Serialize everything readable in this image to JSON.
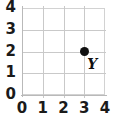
{
  "chart_data": {
    "type": "scatter",
    "title": "",
    "xlabel": "",
    "ylabel": "",
    "xlim": [
      0,
      4
    ],
    "ylim": [
      0,
      4
    ],
    "grid": true,
    "legend": false,
    "x_ticks": [
      "0",
      "1",
      "2",
      "3",
      "4"
    ],
    "y_ticks": [
      "0",
      "1",
      "2",
      "3",
      "4"
    ],
    "x_tick_values": [
      0,
      1,
      2,
      3,
      4
    ],
    "y_tick_values": [
      0,
      1,
      2,
      3,
      4
    ],
    "points": [
      {
        "label": "Y",
        "x": 3,
        "y": 2,
        "color": "#101010"
      }
    ],
    "series": [
      {
        "name": "points",
        "x": [
          3
        ],
        "y": [
          2
        ],
        "labels": [
          "Y"
        ]
      }
    ]
  },
  "colors": {
    "grid": "#c9c9c9",
    "axis": "#b9b9b9",
    "point": "#101010",
    "text": "#1a1a1a",
    "background": "#ffffff"
  }
}
